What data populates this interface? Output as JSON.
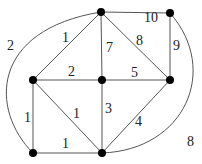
{
  "diagram": {
    "type": "weighted-undirected-graph",
    "nodes": [
      {
        "id": "A",
        "x": 101,
        "y": 12
      },
      {
        "id": "B",
        "x": 170,
        "y": 13
      },
      {
        "id": "C",
        "x": 33,
        "y": 80
      },
      {
        "id": "D",
        "x": 102,
        "y": 80
      },
      {
        "id": "E",
        "x": 170,
        "y": 80
      },
      {
        "id": "F",
        "x": 33,
        "y": 153
      },
      {
        "id": "G",
        "x": 102,
        "y": 153
      }
    ],
    "edges": [
      {
        "from": "C",
        "to": "A",
        "weight": "1"
      },
      {
        "from": "F",
        "to": "A",
        "weight": "2",
        "curved": "left-arc"
      },
      {
        "from": "A",
        "to": "B",
        "weight": "10"
      },
      {
        "from": "A",
        "to": "D",
        "weight": "7"
      },
      {
        "from": "A",
        "to": "E",
        "weight": "8"
      },
      {
        "from": "B",
        "to": "E",
        "weight": "9"
      },
      {
        "from": "C",
        "to": "D",
        "weight": "2"
      },
      {
        "from": "D",
        "to": "E",
        "weight": "5"
      },
      {
        "from": "C",
        "to": "F",
        "weight": "1"
      },
      {
        "from": "C",
        "to": "G",
        "weight": "1"
      },
      {
        "from": "F",
        "to": "G",
        "weight": "1"
      },
      {
        "from": "D",
        "to": "G",
        "weight": "3"
      },
      {
        "from": "G",
        "to": "E",
        "weight": "4"
      },
      {
        "from": "G",
        "to": "B",
        "weight": "8",
        "curved": "right-arc"
      }
    ]
  },
  "labels": {
    "ca": "1",
    "fa": "2",
    "ab": "10",
    "ad": "7",
    "ae": "8",
    "be": "9",
    "cd": "2",
    "de": "5",
    "cf": "1",
    "cg": "1",
    "fg": "1",
    "dg": "3",
    "ge": "4",
    "gb": "8"
  }
}
